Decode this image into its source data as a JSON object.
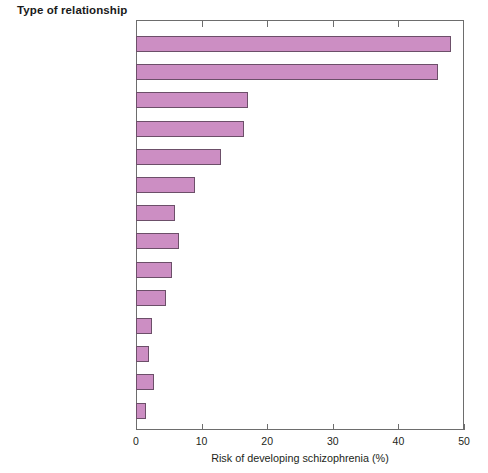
{
  "chart_data": {
    "type": "bar",
    "orientation": "horizontal",
    "title": "Type of relationship",
    "xlabel": "Risk of developing schizophrenia (%)",
    "ylabel": "Type of relationship",
    "xlim": [
      0,
      50
    ],
    "xticks": [
      0,
      10,
      20,
      30,
      40,
      50
    ],
    "grid": false,
    "legend": false,
    "bar_fill_color": "#cc8ec3",
    "bar_edge_color": "#6c4f69",
    "categories": [
      "Identical twins",
      "Offspring of two parents\nwith schizophrenia",
      "Fraternal twins",
      "Siblings with one\nschizophrenic parent",
      "Children",
      "Siblings",
      "Parents",
      "Half siblings",
      "Grandchildren",
      "Nephews/nieces",
      "Uncles/aunts",
      "First cousins\n(third degree)",
      "Spouses of patients",
      "General population"
    ],
    "values": [
      48,
      46,
      17,
      16.5,
      13,
      9,
      6,
      6.5,
      5.5,
      4.5,
      2.5,
      2,
      2.8,
      1.5
    ]
  },
  "axis": {
    "tick_labels": [
      "0",
      "10",
      "20",
      "30",
      "40",
      "50"
    ]
  }
}
